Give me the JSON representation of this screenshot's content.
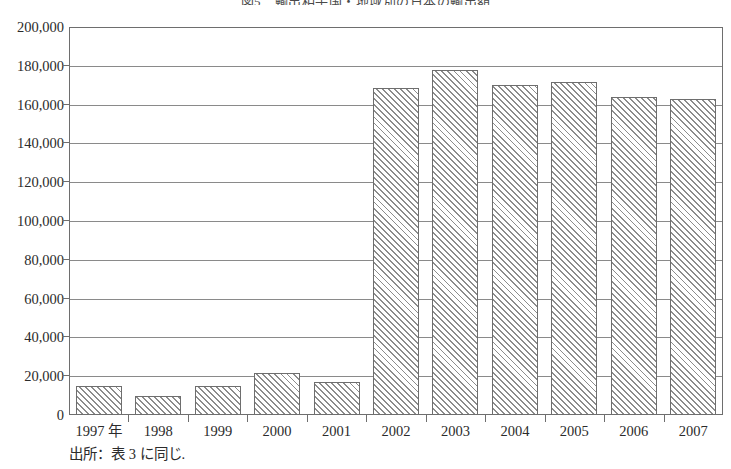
{
  "chart_data": {
    "type": "bar",
    "title": "図5　輸出相手国・地域別の日本の輸出額",
    "xlabel": "",
    "ylabel": "",
    "categories": [
      "1997 年",
      "1998",
      "1999",
      "2000",
      "2001",
      "2002",
      "2003",
      "2004",
      "2005",
      "2006",
      "2007"
    ],
    "values": [
      14800,
      10000,
      14700,
      21500,
      17000,
      168500,
      177800,
      170200,
      171400,
      164000,
      162700
    ],
    "ylim": [
      0,
      200000
    ],
    "ytick_labels": [
      "0",
      "20,000",
      "40,000",
      "60,000",
      "80,000",
      "100,000",
      "120,000",
      "140,000",
      "160,000",
      "180,000",
      "200,000"
    ],
    "ytick_values": [
      0,
      20000,
      40000,
      60000,
      80000,
      100000,
      120000,
      140000,
      160000,
      180000,
      200000
    ],
    "grid": true,
    "legend": false,
    "bar_style": "diagonal-hatch",
    "colors": {
      "bar_fill": "#ffffff",
      "bar_hatch": "#8c8c8c",
      "bar_border": "#6e6e6e",
      "gridline": "#8a8a8a",
      "axis": "#6e6e6e",
      "text": "#2b2b2b"
    }
  },
  "notes": {
    "source": "出所：表 3 に同じ."
  }
}
